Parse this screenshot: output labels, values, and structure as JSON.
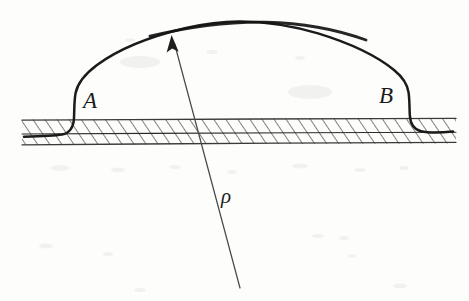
{
  "figure": {
    "domain": "Diagram",
    "background_color": "#fdfdfc",
    "ink_color": "#1b1b1b",
    "hatch_color": "#5a5a58",
    "width": 469,
    "height": 301,
    "labels": {
      "point_a": "A",
      "point_b": "B",
      "radius": "ρ"
    },
    "label_positions": {
      "point_a": {
        "x": 83,
        "y": 108
      },
      "point_b": {
        "x": 379,
        "y": 103
      },
      "radius": {
        "x": 221,
        "y": 203
      }
    },
    "plate": {
      "name": "hatched-plate-band",
      "left_x": 22,
      "right_x": 456,
      "top_y": 119,
      "bottom_y": 144,
      "inner_line_y": 133,
      "hatch_spacing": 10,
      "hatch_angle_deg": 35
    },
    "dome": {
      "name": "bulged-membrane-curve",
      "apex": {
        "x": 236,
        "y": 21
      },
      "left_foot": {
        "x": 60,
        "y": 134
      },
      "right_foot": {
        "x": 430,
        "y": 129
      },
      "left_rise_x": 73,
      "right_rise_x": 409
    },
    "radius_arrow": {
      "name": "radius-of-curvature-arrow",
      "tip": {
        "x": 172,
        "y": 37
      },
      "tail": {
        "x": 240,
        "y": 288
      },
      "arrowhead_length": 16,
      "arrowhead_width": 7
    }
  }
}
